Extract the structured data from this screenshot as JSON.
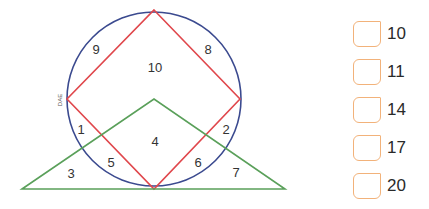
{
  "diagram": {
    "colors": {
      "circle": "#3b4a8f",
      "square": "#e0474c",
      "triangle": "#5aa05a"
    },
    "side_label": "DAE",
    "regions": [
      {
        "id": "1",
        "label": "1",
        "x": 81,
        "y": 131
      },
      {
        "id": "2",
        "label": "2",
        "x": 226,
        "y": 131
      },
      {
        "id": "3",
        "label": "3",
        "x": 71,
        "y": 175
      },
      {
        "id": "4",
        "label": "4",
        "x": 155,
        "y": 143
      },
      {
        "id": "5",
        "label": "5",
        "x": 111,
        "y": 164
      },
      {
        "id": "6",
        "label": "6",
        "x": 198,
        "y": 164
      },
      {
        "id": "7",
        "label": "7",
        "x": 236,
        "y": 174
      },
      {
        "id": "8",
        "label": "8",
        "x": 208,
        "y": 51
      },
      {
        "id": "9",
        "label": "9",
        "x": 96,
        "y": 51
      },
      {
        "id": "10",
        "label": "10",
        "x": 155,
        "y": 69
      }
    ]
  },
  "options": [
    {
      "label": "10",
      "checked": false
    },
    {
      "label": "11",
      "checked": false
    },
    {
      "label": "14",
      "checked": false
    },
    {
      "label": "17",
      "checked": false
    },
    {
      "label": "20",
      "checked": false
    }
  ]
}
